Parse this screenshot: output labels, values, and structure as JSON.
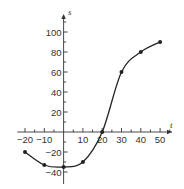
{
  "chart_data": {
    "type": "line",
    "title": "",
    "xlabel": "t",
    "ylabel": "s",
    "x": [
      -20,
      -10,
      0,
      10,
      20,
      30,
      40,
      50
    ],
    "series": [
      {
        "name": "s(t)",
        "values": [
          -20,
          -33,
          -35,
          -30,
          0,
          60,
          80,
          90
        ],
        "markers": true,
        "smooth": true
      }
    ],
    "xticks": [
      -20,
      -10,
      10,
      20,
      30,
      40,
      50
    ],
    "xtick_labels": [
      "-20",
      "-10",
      "10",
      "20",
      "30",
      "40",
      "50"
    ],
    "yticks": [
      -40,
      -20,
      20,
      40,
      60,
      80,
      100
    ],
    "ytick_labels": [
      "-40",
      "-20",
      "20",
      "40",
      "60",
      "80",
      "100"
    ],
    "xlim": [
      -23,
      57
    ],
    "ylim": [
      -45,
      115
    ],
    "grid": false,
    "legend": "none",
    "colors": {
      "line": "#222222",
      "axis": "#333333"
    }
  }
}
